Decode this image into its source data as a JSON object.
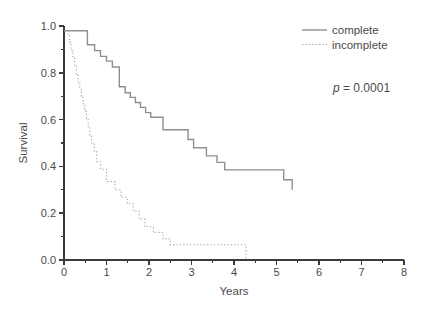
{
  "chart_data": {
    "type": "line",
    "subtype": "kaplan-meier-step",
    "title": "",
    "xlabel": "Years",
    "ylabel": "Survival",
    "xlim": [
      0,
      8
    ],
    "ylim": [
      0.0,
      1.0
    ],
    "xticks": [
      0,
      1,
      2,
      3,
      4,
      5,
      6,
      7,
      8
    ],
    "xtick_labels": [
      "0",
      "1",
      "2",
      "3",
      "4",
      "5",
      "6",
      "7",
      "8"
    ],
    "x_minor_step": 0.5,
    "yticks": [
      0.0,
      0.2,
      0.4,
      0.6,
      0.8,
      1.0
    ],
    "ytick_labels": [
      "0.0",
      "0.2",
      "0.4",
      "0.6",
      "0.8",
      "1.0"
    ],
    "y_minor_step": 0.1,
    "grid": false,
    "legend_position": "top-right",
    "annotation": {
      "symbol": "p",
      "rest": " = 0.0001"
    },
    "series": [
      {
        "name": "complete",
        "style": "solid",
        "color": "#8f8f8f",
        "points": [
          [
            0,
            0.98
          ],
          [
            0.55,
            0.92
          ],
          [
            0.72,
            0.895
          ],
          [
            0.86,
            0.87
          ],
          [
            1.0,
            0.85
          ],
          [
            1.14,
            0.825
          ],
          [
            1.3,
            0.74
          ],
          [
            1.44,
            0.715
          ],
          [
            1.56,
            0.695
          ],
          [
            1.68,
            0.673
          ],
          [
            1.8,
            0.652
          ],
          [
            1.92,
            0.63
          ],
          [
            2.04,
            0.61
          ],
          [
            2.33,
            0.557
          ],
          [
            2.92,
            0.515
          ],
          [
            3.05,
            0.48
          ],
          [
            3.35,
            0.445
          ],
          [
            3.6,
            0.417
          ],
          [
            3.78,
            0.385
          ],
          [
            5.17,
            0.343
          ],
          [
            5.37,
            0.3
          ]
        ]
      },
      {
        "name": "incomplete",
        "style": "dotted",
        "color": "#a6a6a6",
        "points": [
          [
            0.08,
            0.965
          ],
          [
            0.13,
            0.93
          ],
          [
            0.17,
            0.895
          ],
          [
            0.21,
            0.862
          ],
          [
            0.25,
            0.828
          ],
          [
            0.29,
            0.795
          ],
          [
            0.33,
            0.762
          ],
          [
            0.37,
            0.73
          ],
          [
            0.41,
            0.7
          ],
          [
            0.45,
            0.668
          ],
          [
            0.49,
            0.635
          ],
          [
            0.53,
            0.6
          ],
          [
            0.57,
            0.565
          ],
          [
            0.61,
            0.532
          ],
          [
            0.65,
            0.5
          ],
          [
            0.71,
            0.462
          ],
          [
            0.77,
            0.42
          ],
          [
            0.86,
            0.388
          ],
          [
            1.0,
            0.335
          ],
          [
            1.2,
            0.3
          ],
          [
            1.34,
            0.268
          ],
          [
            1.49,
            0.24
          ],
          [
            1.63,
            0.208
          ],
          [
            1.77,
            0.175
          ],
          [
            1.9,
            0.142
          ],
          [
            2.1,
            0.118
          ],
          [
            2.33,
            0.09
          ],
          [
            2.5,
            0.065
          ],
          [
            4.28,
            0.0
          ]
        ]
      }
    ]
  },
  "colors": {
    "axis": "#3b3b3b",
    "text": "#4a4a4a",
    "background": "#ffffff"
  }
}
